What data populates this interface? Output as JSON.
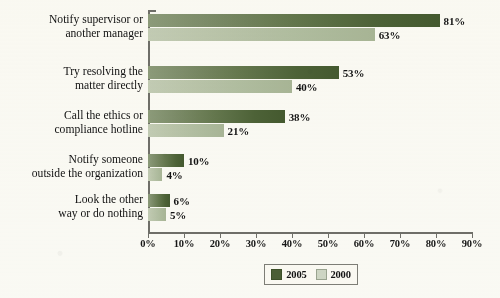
{
  "chart_data": {
    "type": "bar",
    "orientation": "horizontal",
    "title": "",
    "xlabel": "",
    "ylabel": "",
    "xlim": [
      0,
      90
    ],
    "grid": false,
    "legend_position": "bottom-center",
    "categories": [
      "Notify supervisor or\nanother manager",
      "Try resolving the\nmatter directly",
      "Call the ethics or\ncompliance hotline",
      "Notify someone\noutside the organization",
      "Look the other\nway or do nothing"
    ],
    "category_lines": [
      [
        "Notify supervisor or",
        "another manager"
      ],
      [
        "Try resolving the",
        "matter directly"
      ],
      [
        "Call the ethics or",
        "compliance hotline"
      ],
      [
        "Notify someone",
        "outside the organization"
      ],
      [
        "Look the other",
        "way or do nothing"
      ]
    ],
    "series": [
      {
        "name": "2005",
        "color": "#4b5f36",
        "values": [
          81,
          53,
          38,
          10,
          6
        ],
        "labels": [
          "81%",
          "53%",
          "38%",
          "10%",
          "6%"
        ]
      },
      {
        "name": "2000",
        "color": "#c3cdb7",
        "values": [
          63,
          40,
          21,
          4,
          5
        ],
        "labels": [
          "63%",
          "40%",
          "21%",
          "4%",
          "5%"
        ]
      }
    ],
    "x_ticks": [
      0,
      10,
      20,
      30,
      40,
      50,
      60,
      70,
      80,
      90
    ],
    "x_tick_labels": [
      "0%",
      "10%",
      "20%",
      "30%",
      "40%",
      "50%",
      "60%",
      "70%",
      "80%",
      "90%"
    ]
  },
  "legend": {
    "entries": [
      {
        "label": "2005",
        "color": "#4b5f36"
      },
      {
        "label": "2000",
        "color": "#cfd7c6"
      }
    ]
  }
}
